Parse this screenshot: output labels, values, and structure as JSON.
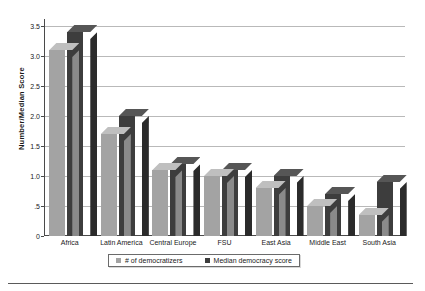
{
  "chart_data": {
    "type": "bar",
    "title": "",
    "subtitle": "",
    "xlabel": "",
    "ylabel": "Number/Median  Score",
    "ylim": [
      0,
      3.5
    ],
    "ytick_labels": [
      "3.5",
      "3.0",
      "2.5",
      "2.0",
      "1.5",
      "1.0",
      ".5",
      "0"
    ],
    "ytick_values": [
      3.5,
      3.0,
      2.5,
      2.0,
      1.5,
      1.0,
      0.5,
      0.0
    ],
    "grid": true,
    "legend_position": "bottom",
    "style": "3d-clustered-column",
    "categories": [
      "Africa",
      "Latin  America",
      "Central  Europe",
      "FSU",
      "East Asia",
      "Middle East",
      "South Asia"
    ],
    "series": [
      {
        "name": "# of democratizers",
        "color": "#a3a3a3",
        "values": [
          3.1,
          1.7,
          1.1,
          1.0,
          0.8,
          0.5,
          0.35
        ]
      },
      {
        "name": "Median democracy score",
        "color": "#3d3d3d",
        "values": [
          3.4,
          2.0,
          1.2,
          1.1,
          1.0,
          0.7,
          0.9
        ]
      }
    ]
  },
  "legend": {
    "items": [
      {
        "label": "# of  democratizers",
        "swatch": "light"
      },
      {
        "label": "Median democracy score",
        "swatch": "dark"
      }
    ]
  },
  "axis": {
    "y_title": "Number/Median  Score"
  }
}
